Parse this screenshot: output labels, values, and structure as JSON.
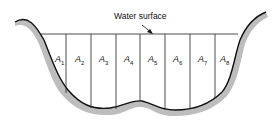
{
  "diagram": {
    "callout": "Water surface",
    "areas": [
      {
        "letter": "A",
        "sub": "1",
        "x": 55
      },
      {
        "letter": "A",
        "sub": "2",
        "x": 75
      },
      {
        "letter": "A",
        "sub": "3",
        "x": 99
      },
      {
        "letter": "A",
        "sub": "4",
        "x": 124
      },
      {
        "letter": "A",
        "sub": "5",
        "x": 148
      },
      {
        "letter": "A",
        "sub": "6",
        "x": 173
      },
      {
        "letter": "A",
        "sub": "7",
        "x": 198
      },
      {
        "letter": "A",
        "sub": "8",
        "x": 220
      }
    ]
  }
}
